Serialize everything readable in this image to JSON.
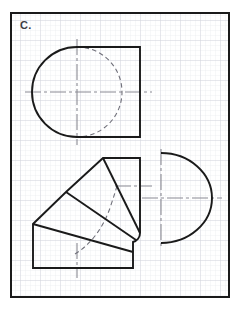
{
  "worksheet": {
    "problem_label": "C.",
    "background_color": "#ffffff",
    "frame": {
      "color": "#1a1a1a",
      "x": 11,
      "y": 13,
      "width": 218,
      "height": 284,
      "stroke_width": 2
    },
    "grid": {
      "minor_color": "#e6e7ec",
      "major_color": "#d2d4dc",
      "minor_spacing": 5,
      "major_spacing": 20
    },
    "line_styles": {
      "visible_edge_color": "#1a1a1a",
      "visible_edge_width": 1.9,
      "hidden_edge_color": "#6e6e78",
      "hidden_edge_width": 1.1,
      "hidden_dash": "4,3",
      "center_line_color": "#8a8a93",
      "center_line_width": 1.1,
      "center_dash": "14,3,3,3"
    }
  },
  "views": {
    "top_view": {
      "name": "front-view-d-shape",
      "description": "D-shaped outline: square right side with semicircular left end, hidden circle shown dashed",
      "center": {
        "x": 77,
        "y": 92
      },
      "body": {
        "right_x": 140,
        "top_y": 47,
        "bottom_y": 137,
        "arc_radius": 45,
        "arc_center_x": 77
      },
      "hidden_circle": {
        "center_x": 77,
        "center_y": 92,
        "radius": 45,
        "visible_half": "right"
      },
      "center_lines": {
        "horizontal": {
          "x1": 25,
          "y1": 92,
          "x2": 152,
          "y2": 92
        },
        "vertical": {
          "x1": 77,
          "y1": 39,
          "x2": 77,
          "y2": 145
        }
      }
    },
    "bottom_left_view": {
      "name": "development-pattern",
      "description": "Unfolded development of the transition piece built from four angular panels radiating from a lower right hinge, with hidden seam arc",
      "outline_points": [
        {
          "x": 33,
          "y": 268
        },
        {
          "x": 33,
          "y": 224
        },
        {
          "x": 66,
          "y": 192
        },
        {
          "x": 103,
          "y": 158
        },
        {
          "x": 140,
          "y": 158
        },
        {
          "x": 140,
          "y": 232
        },
        {
          "x": 133,
          "y": 240
        },
        {
          "x": 133,
          "y": 268
        }
      ],
      "fold_lines": [
        {
          "x1": 33,
          "y1": 224,
          "x2": 133,
          "y2": 252
        },
        {
          "x1": 66,
          "y1": 192,
          "x2": 136,
          "y2": 238
        },
        {
          "x1": 103,
          "y1": 158,
          "x2": 140,
          "y2": 232
        }
      ],
      "corner_arc": {
        "from_x": 133,
        "from_y": 252,
        "to_x": 140,
        "to_y": 243,
        "radius": 9
      },
      "hidden_arc": {
        "description": "dashed curved seam through the panel interiors",
        "points": [
          {
            "x": 77,
            "y": 252
          },
          {
            "x": 92,
            "y": 232
          },
          {
            "x": 104,
            "y": 213
          },
          {
            "x": 112,
            "y": 197
          },
          {
            "x": 117,
            "y": 186
          }
        ]
      },
      "center_lines": {
        "horizontal": {
          "x1": 117,
          "y1": 186,
          "x2": 152,
          "y2": 186
        },
        "vertical": {
          "x1": 77,
          "y1": 245,
          "x2": 77,
          "y2": 276
        }
      }
    },
    "bottom_right_view": {
      "name": "side-view-semicircle",
      "description": "Semicircular D outline with flat vertical edge on the left and arc bulging right",
      "flat_edge_x": 161,
      "top_y": 153,
      "bottom_y": 243,
      "arc_radius_x": 51,
      "arc_radius_y": 45,
      "center": {
        "x": 161,
        "y": 198
      },
      "center_lines": {
        "horizontal": {
          "x1": 142,
          "y1": 198,
          "x2": 222,
          "y2": 198
        },
        "vertical": {
          "x1": 161,
          "y1": 149,
          "x2": 161,
          "y2": 247
        }
      }
    }
  }
}
